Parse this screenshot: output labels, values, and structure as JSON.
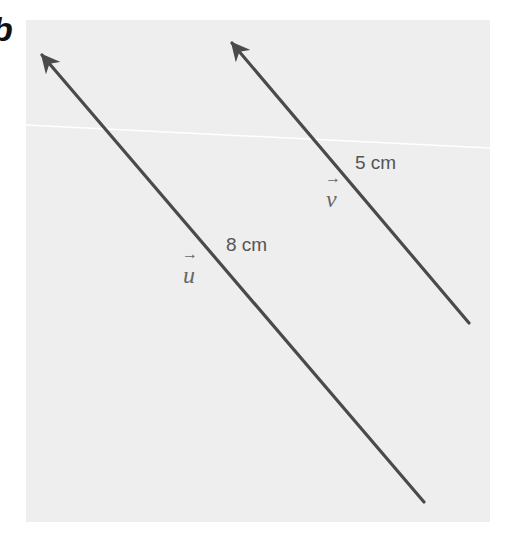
{
  "figure": {
    "panel_letter": "b",
    "background_color": "#eeeeee",
    "stroke_color": "#4a4a4a",
    "vectors": [
      {
        "name": "u",
        "symbol": "u",
        "arrow_glyph": "→",
        "length_label": "8 cm",
        "tail": [
          424,
          502
        ],
        "head": [
          40,
          52
        ]
      },
      {
        "name": "v",
        "symbol": "v",
        "arrow_glyph": "→",
        "length_label": "5 cm",
        "tail": [
          469,
          323
        ],
        "head": [
          230,
          40
        ]
      }
    ]
  }
}
